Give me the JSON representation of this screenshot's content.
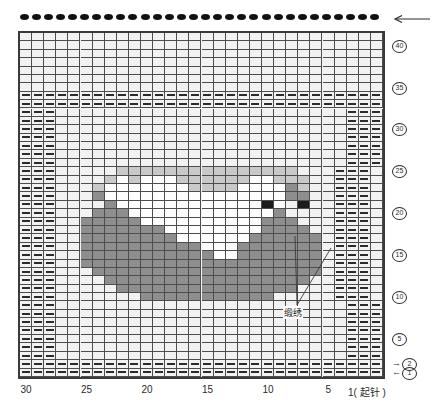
{
  "chart_data": {
    "type": "heatmap",
    "title": "",
    "xlabel": "",
    "ylabel": "",
    "grid": true,
    "columns": 30,
    "rows": 41,
    "column_order": "right-to-left",
    "x_tick_labels": [
      "30",
      "25",
      "20",
      "15",
      "10",
      "5",
      "1"
    ],
    "x_tick_columns": [
      30,
      25,
      20,
      15,
      10,
      5,
      1
    ],
    "x_origin_label": "1( 起针 )",
    "y_tick_labels": [
      "40",
      "35",
      "30",
      "25",
      "20",
      "15",
      "10",
      "5",
      "2",
      "1"
    ],
    "y_tick_rows": [
      40,
      35,
      30,
      25,
      20,
      15,
      10,
      5,
      2,
      1
    ],
    "row_direction_markers": {
      "row2": "→",
      "row1": "←"
    },
    "top_direction_marker": "←",
    "legend": [
      {
        "key": "bg",
        "color": "#f2f2f2",
        "label": "background"
      },
      {
        "key": "white",
        "color": "#fdfdfd",
        "label": "white"
      },
      {
        "key": "light",
        "color": "#c9c9c9",
        "label": "light-gray"
      },
      {
        "key": "dark",
        "color": "#8e8e8e",
        "label": "dark-gray"
      },
      {
        "key": "black",
        "color": "#1b1b1b",
        "label": "black"
      }
    ],
    "symbol": {
      "name": "purl-dash",
      "color": "#2b2b2b"
    },
    "cast_on_dots": 30,
    "cast_on_dot_color": "#111111",
    "pattern_rows": [
      "dddddddddddddddddddddddddddddd",
      "dddddddddddddddddddddddddddddd",
      "ddd........................ddd",
      "ddd........................ddd",
      "ddd........................ddd",
      "ddd........................ddd",
      "ddd........................ddd",
      "ddd........................ddd",
      "ddd........................ddd",
      "ddd.......GGGGGGGGGGG.....ddd",
      "ddd.....GGGGGGGGGGGGGGG...ddd",
      "ddd....GGGGGGGGGGGGGGGGG..ddd",
      "ddd...GGGGGGGGGGGGGGGGGGG.ddd",
      "ddd..GGGGGGGGGGGGGGGGGGGG.ddd",
      "ddd..GGGGGGGGGGGWWGGGGGGG.ddd",
      "ddd..GGGGGGGGGGWWWGGGGGGG.ddd",
      "ddd..GGGGGGGGWWWWWWGGGGGG.ddd",
      "ddd..GGGGGGGWWWWWWWWGGGG..ddd",
      "ddd..GGGGGWWWWWWWWWWGGG...ddd",
      "ddd...GGGWWWWWWWWWWWWG....ddd",
      "ddd....GWWWWWWWWWWWWbW.b..ddd",
      "ddd...GWWWWWWWWWWWWWWWGG..ddd",
      "ddd...LWWWWWWWLLLLWWWWGL..ddd",
      "ddd....LWLWWWLLLLLLWWLLL..ddd",
      "ddd.....LLLLLLLLLLLLLLL...ddd",
      "ddd........................ddd",
      "ddd........................ddd",
      "ddd........................ddd",
      "ddd........................ddd",
      "ddd........................ddd",
      "ddd........................ddd",
      "ddd........................ddd",
      "dddddddddddddddddddddddddddddd",
      "dddddddddddddddddddddddddddddd",
      "..............................",
      "..............................",
      "..............................",
      "..............................",
      "..............................",
      "..............................",
      ".............................."
    ]
  },
  "annotation": {
    "label": "缎绣",
    "targets": [
      {
        "name": "left-embroidery-mark",
        "x": 295,
        "y": 236
      },
      {
        "name": "right-embroidery-mark",
        "x": 331,
        "y": 248
      }
    ],
    "anchor": {
      "x": 297,
      "y": 305
    }
  }
}
